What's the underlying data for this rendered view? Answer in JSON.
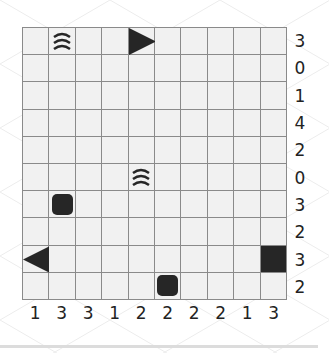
{
  "puzzle": {
    "rows": 10,
    "cols": 10,
    "row_clues": [
      "3",
      "0",
      "1",
      "4",
      "2",
      "0",
      "3",
      "2",
      "3",
      "2"
    ],
    "col_clues": [
      "1",
      "3",
      "3",
      "1",
      "2",
      "2",
      "2",
      "2",
      "1",
      "3"
    ],
    "pieces": [
      {
        "row": 0,
        "col": 1,
        "type": "water",
        "icon": "water-waves-icon"
      },
      {
        "row": 0,
        "col": 4,
        "type": "ship-end-right",
        "icon": "triangle-right-icon"
      },
      {
        "row": 5,
        "col": 4,
        "type": "water",
        "icon": "water-waves-icon"
      },
      {
        "row": 6,
        "col": 1,
        "type": "submarine",
        "icon": "rounded-square-icon"
      },
      {
        "row": 8,
        "col": 0,
        "type": "ship-end-left",
        "icon": "triangle-left-icon"
      },
      {
        "row": 8,
        "col": 9,
        "type": "ship-middle",
        "icon": "square-icon"
      },
      {
        "row": 9,
        "col": 5,
        "type": "submarine",
        "icon": "rounded-square-icon"
      }
    ]
  },
  "colors": {
    "cell_bg": "#f1f1f1",
    "grid_line": "#8a8a8a",
    "piece": "#262626",
    "clue_text": "#222222",
    "background": "#ffffff"
  }
}
